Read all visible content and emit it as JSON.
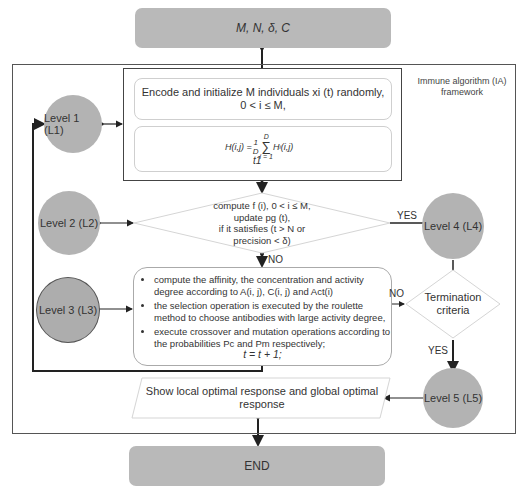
{
  "start": {
    "label": "M, N, δ, C"
  },
  "frame": {
    "caption_line1": "Immune algorithm (IA)",
    "caption_line2": "framework"
  },
  "init_box": {
    "line1": "Encode and initialize M individuals xi (t) randomly,",
    "line2": "0 < i ≤ M,"
  },
  "formula_box": {
    "formula": "H(i,j) = (1/D) Σ_{i=1}^{D} H_i(i,j)",
    "lhs": "H(i,j) =",
    "frac_num": "1",
    "frac_den": "D",
    "sum_top": "D",
    "sum_bottom": "i = 1",
    "sum_symbol": "∑",
    "rhs": "H",
    "rhs_sub": "i",
    "rhs_args": "(i,j)",
    "tail": "t1"
  },
  "decision1": {
    "line1": "compute f (i), 0 < i ≤ M,",
    "line2": "update pg (t),",
    "line3": "if it satisfies (t > N or",
    "line4": "precision < δ)"
  },
  "process_box": {
    "bullets": [
      "compute the affinity, the concentration and activity degree according to A(i, j), C(i, j) and Act(i)",
      "the selection operation is executed by the roulette method to choose antibodies with large activity degree,",
      "execute crossover and mutation operations according to the probabilities Pc and Pm respectively;"
    ],
    "update": "t = t + 1;"
  },
  "levels": [
    {
      "label": "Level 1 (L1)"
    },
    {
      "label": "Level 2 (L2)"
    },
    {
      "label": "Level 3 (L3)"
    },
    {
      "label": "Level 4 (L4)"
    },
    {
      "label": "Level 5 (L5)"
    }
  ],
  "termination": {
    "line1": "Termination",
    "line2": "criteria"
  },
  "edge_labels": {
    "yes_top": "YES",
    "no_mid": "NO",
    "no_right": "NO",
    "yes_bottom": "YES"
  },
  "output_box": {
    "line1": "Show local optimal response and global optimal",
    "line2": "response"
  },
  "end": {
    "label": "END"
  },
  "colors": {
    "node_fill": "#b9b9b9",
    "line": "#222222",
    "light_border": "#cfcfcf"
  }
}
